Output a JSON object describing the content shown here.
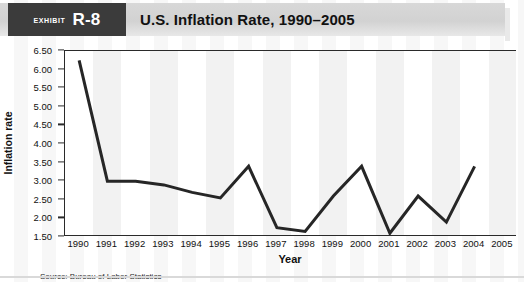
{
  "header": {
    "exhibit_word": "Exhibit",
    "exhibit_number": "R-8",
    "title": "U.S. Inflation Rate, 1990–2005",
    "tag_bg": "#3b3b3b",
    "band_bg": "#d4d4d4"
  },
  "source_note": "Source: Bureau of Labor Statistics",
  "chart_data": {
    "type": "line",
    "title": "U.S. Inflation Rate, 1990–2005",
    "xlabel": "Year",
    "ylabel": "Inflation rate",
    "categories": [
      "1990",
      "1991",
      "1992",
      "1993",
      "1994",
      "1995",
      "1996",
      "1997",
      "1998",
      "1999",
      "2000",
      "2001",
      "2002",
      "2003",
      "2004",
      "2005"
    ],
    "values": [
      6.25,
      3.0,
      3.0,
      2.9,
      2.7,
      2.55,
      3.4,
      1.75,
      1.65,
      2.6,
      3.4,
      1.6,
      2.6,
      1.9,
      3.4,
      null
    ],
    "ylim": [
      1.5,
      6.5
    ],
    "ytick_labels": [
      "6.50",
      "6.00",
      "5.50",
      "5.00",
      "4.50",
      "4.00",
      "3.50",
      "3.00",
      "2.50",
      "2.00",
      "1.50"
    ],
    "ytick_values": [
      6.5,
      6.0,
      5.5,
      5.0,
      4.5,
      4.0,
      3.5,
      3.0,
      2.5,
      2.0,
      1.5
    ],
    "grid": false,
    "legend": "none",
    "line_color": "#262626",
    "line_width": 3.0,
    "plot_background": "#ffffff",
    "stripe_color": "#f2f2f2"
  }
}
